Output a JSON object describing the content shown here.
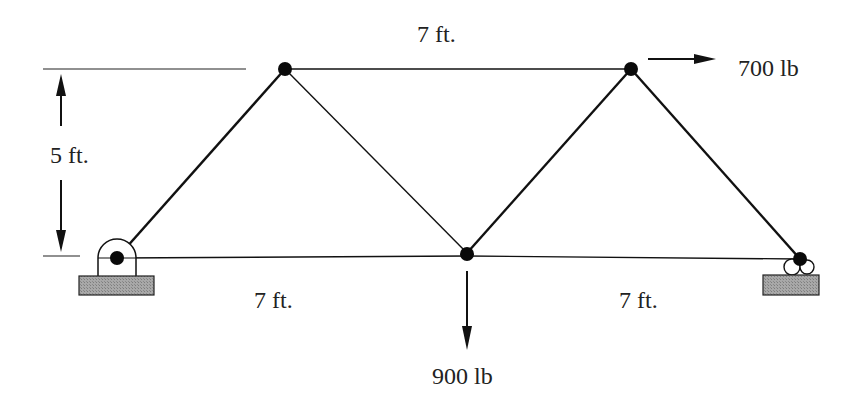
{
  "diagram": {
    "type": "truss",
    "labels": {
      "top_span": "7 ft.",
      "height": "5 ft.",
      "bottom_left_span": "7 ft.",
      "bottom_right_span": "7 ft.",
      "load_horizontal": "700 lb",
      "load_vertical": "900 lb"
    },
    "joints": [
      {
        "id": "A",
        "x": 117,
        "y": 258,
        "support": "pin"
      },
      {
        "id": "B",
        "x": 285,
        "y": 69
      },
      {
        "id": "C",
        "x": 467,
        "y": 253
      },
      {
        "id": "D",
        "x": 631,
        "y": 69
      },
      {
        "id": "E",
        "x": 800,
        "y": 259,
        "support": "roller"
      }
    ],
    "colors": {
      "line": "#111111",
      "support_fill": "#9a9a9a",
      "text": "#222222"
    }
  }
}
